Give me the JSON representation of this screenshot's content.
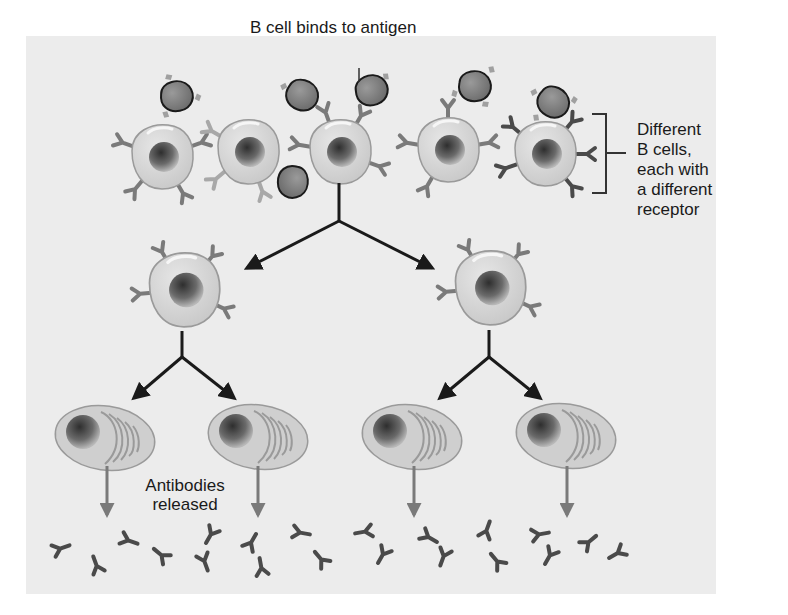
{
  "diagram": {
    "colors": {
      "background_panel": "#ececec",
      "cell_fill": "#d4d4d4",
      "cell_outline": "#9a9a9a",
      "nucleus": "#5a5a5a",
      "antigen_fill": "#7d7d7d",
      "antigen_outline": "#1a1a1a",
      "receptor_dark": "#4a4a4a",
      "receptor_light": "#9c9c9c",
      "arrow_black": "#1a1a1a",
      "arrow_gray": "#7a7a7a"
    },
    "labels": {
      "binding": "B cell binds to antigen",
      "bracket_lines": [
        "Different",
        "B cells,",
        "each with",
        "a different",
        "receptor"
      ],
      "antibodies_lines": [
        "Antibodies",
        "released"
      ]
    },
    "stages": [
      {
        "name": "initial B cells",
        "count": 5
      },
      {
        "name": "cloned B cells",
        "count": 2
      },
      {
        "name": "plasma cells",
        "count": 4
      },
      {
        "name": "antibodies",
        "count": 20
      }
    ]
  }
}
